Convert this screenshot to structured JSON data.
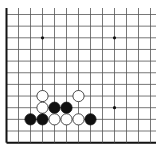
{
  "board": {
    "description": "Go board corner (lower-left) diagram",
    "columns": 13,
    "rows": 12,
    "origin_x": 6.5,
    "origin_y": 14.5,
    "spacing_x": 12.0,
    "spacing_y": 11.65,
    "line_end_x": 156,
    "line_start_y": 8,
    "colors": {
      "background": "#ffffff",
      "grid": "#555555",
      "edge": "#111111",
      "black_stone": "#111111",
      "white_stone": "#ffffff",
      "white_stone_outline": "#222222",
      "star_point": "#111111"
    },
    "edges": [
      "left",
      "bottom"
    ],
    "star_points": [
      {
        "col": 3,
        "row": 2
      },
      {
        "col": 9,
        "row": 2
      },
      {
        "col": 9,
        "row": 8
      }
    ],
    "stones": [
      {
        "color": "white",
        "col": 3,
        "row": 7
      },
      {
        "color": "white",
        "col": 6,
        "row": 7
      },
      {
        "color": "white",
        "col": 3,
        "row": 8
      },
      {
        "color": "black",
        "col": 4,
        "row": 8
      },
      {
        "color": "black",
        "col": 5,
        "row": 8
      },
      {
        "color": "black",
        "col": 2,
        "row": 9
      },
      {
        "color": "black",
        "col": 3,
        "row": 9
      },
      {
        "color": "white",
        "col": 4,
        "row": 9
      },
      {
        "color": "white",
        "col": 5,
        "row": 9
      },
      {
        "color": "white",
        "col": 6,
        "row": 9
      },
      {
        "color": "black",
        "col": 7,
        "row": 9
      }
    ]
  }
}
